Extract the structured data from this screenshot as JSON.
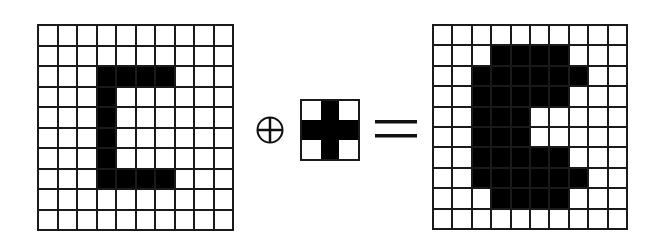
{
  "diagram": {
    "input_image": {
      "rows": 10,
      "cols": 10,
      "pixels": [
        [
          0,
          0,
          0,
          0,
          0,
          0,
          0,
          0,
          0,
          0
        ],
        [
          0,
          0,
          0,
          0,
          0,
          0,
          0,
          0,
          0,
          0
        ],
        [
          0,
          0,
          0,
          1,
          1,
          1,
          1,
          0,
          0,
          0
        ],
        [
          0,
          0,
          0,
          1,
          0,
          0,
          0,
          0,
          0,
          0
        ],
        [
          0,
          0,
          0,
          1,
          0,
          0,
          0,
          0,
          0,
          0
        ],
        [
          0,
          0,
          0,
          1,
          0,
          0,
          0,
          0,
          0,
          0
        ],
        [
          0,
          0,
          0,
          1,
          0,
          0,
          0,
          0,
          0,
          0
        ],
        [
          0,
          0,
          0,
          1,
          1,
          1,
          1,
          0,
          0,
          0
        ],
        [
          0,
          0,
          0,
          0,
          0,
          0,
          0,
          0,
          0,
          0
        ],
        [
          0,
          0,
          0,
          0,
          0,
          0,
          0,
          0,
          0,
          0
        ]
      ]
    },
    "operator": {
      "symbol": "dilation",
      "icon": "circle-plus-icon"
    },
    "structuring_element": {
      "rows": 3,
      "cols": 3,
      "pixels": [
        [
          0,
          1,
          0
        ],
        [
          1,
          1,
          1
        ],
        [
          0,
          1,
          0
        ]
      ]
    },
    "equals": {
      "icon": "equals-icon"
    },
    "output_image": {
      "rows": 10,
      "cols": 10,
      "pixels": [
        [
          0,
          0,
          0,
          0,
          0,
          0,
          0,
          0,
          0,
          0
        ],
        [
          0,
          0,
          0,
          1,
          1,
          1,
          1,
          0,
          0,
          0
        ],
        [
          0,
          0,
          1,
          1,
          1,
          1,
          1,
          1,
          0,
          0
        ],
        [
          0,
          0,
          1,
          1,
          1,
          1,
          1,
          0,
          0,
          0
        ],
        [
          0,
          0,
          1,
          1,
          1,
          0,
          0,
          0,
          0,
          0
        ],
        [
          0,
          0,
          1,
          1,
          1,
          0,
          0,
          0,
          0,
          0
        ],
        [
          0,
          0,
          1,
          1,
          1,
          1,
          1,
          0,
          0,
          0
        ],
        [
          0,
          0,
          1,
          1,
          1,
          1,
          1,
          1,
          0,
          0
        ],
        [
          0,
          0,
          0,
          1,
          1,
          1,
          1,
          0,
          0,
          0
        ],
        [
          0,
          0,
          0,
          0,
          0,
          0,
          0,
          0,
          0,
          0
        ]
      ]
    },
    "colors": {
      "on": "#000000",
      "off": "#ffffff",
      "line": "#1a1a1a"
    }
  }
}
